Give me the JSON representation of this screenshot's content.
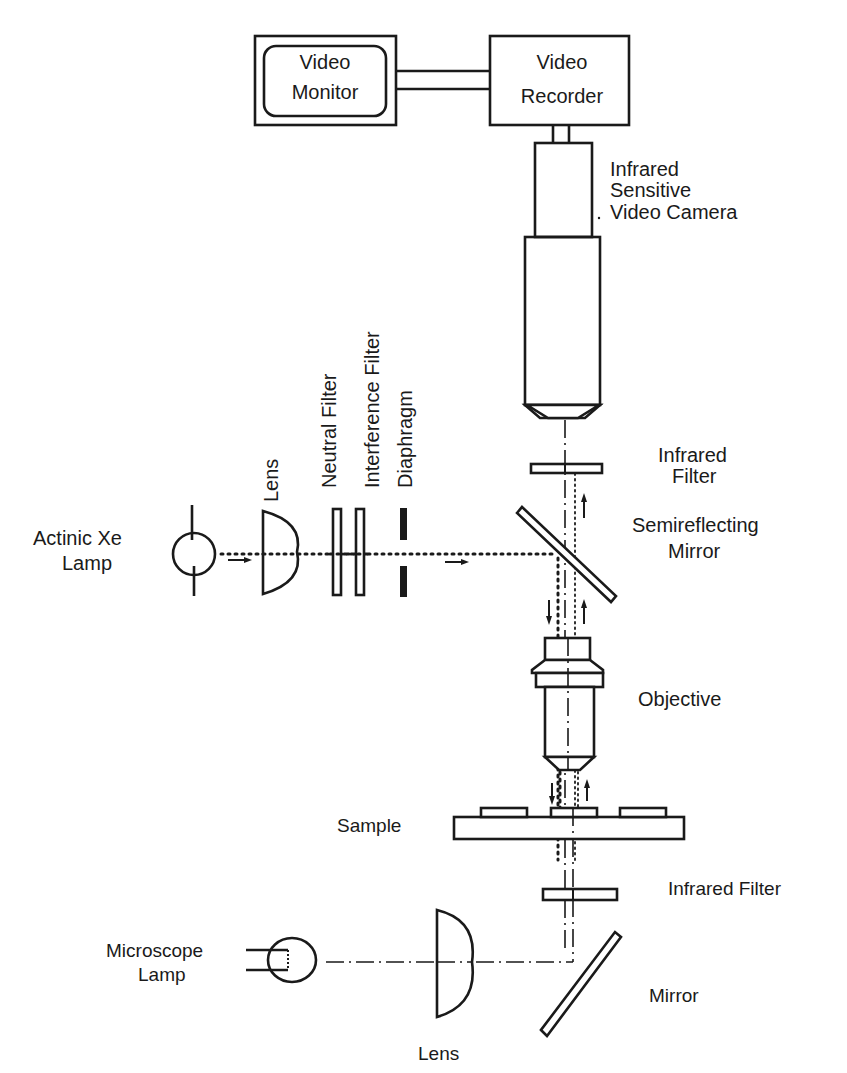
{
  "diagram": {
    "type": "optical-setup-schematic",
    "components": {
      "video_monitor": {
        "line1": "Video",
        "line2": "Monitor"
      },
      "video_recorder": {
        "line1": "Video",
        "line2": "Recorder"
      },
      "camera": {
        "line1": "Infrared",
        "line2": "Sensitive",
        "line3": "Video Camera"
      },
      "upper_ir_filter": {
        "line1": "Infrared",
        "line2": "Filter"
      },
      "semireflecting_mirror": {
        "line1": "Semireflecting",
        "line2": "Mirror"
      },
      "actinic_lamp": {
        "line1": "Actinic  Xe",
        "line2": "Lamp"
      },
      "actinic_lens": {
        "label": "Lens"
      },
      "neutral_filter": {
        "label": "Neutral  Filter"
      },
      "interference_filter": {
        "label": "Interference  Filter"
      },
      "diaphragm": {
        "label": "Diaphragm"
      },
      "objective": {
        "label": "Objective"
      },
      "sample": {
        "label": "Sample"
      },
      "lower_ir_filter": {
        "label": "Infrared  Filter"
      },
      "microscope_lamp": {
        "line1": "Microscope",
        "line2": "Lamp"
      },
      "lower_lens": {
        "label": "Lens"
      },
      "lower_mirror": {
        "label": "Mirror"
      }
    },
    "beam_directions": {
      "actinic_input": "right",
      "actinic_to_sample": "down",
      "fluorescence_to_camera": "up"
    }
  }
}
